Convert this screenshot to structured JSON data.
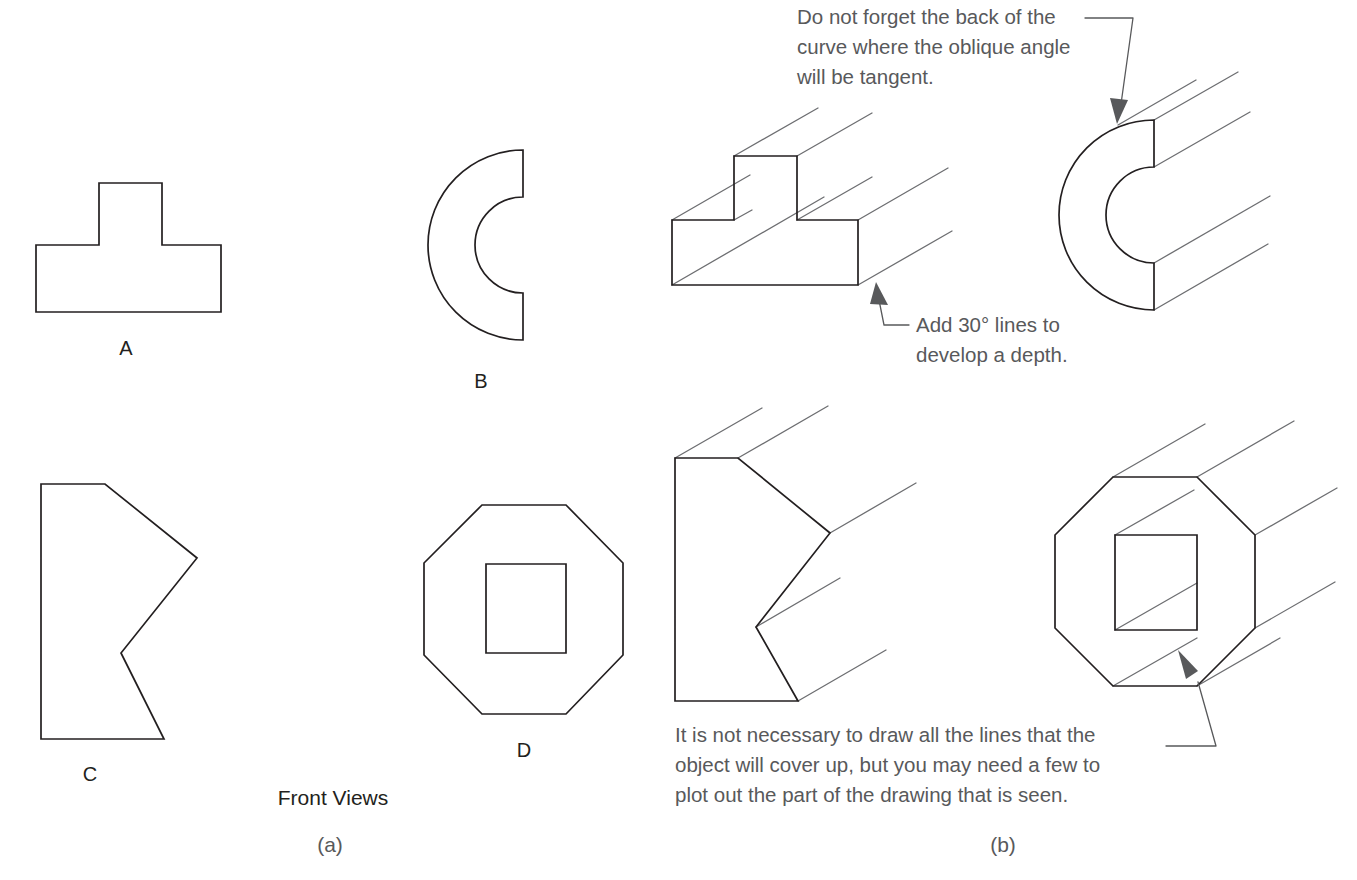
{
  "figure": {
    "panels": [
      {
        "key": "a",
        "caption": "(a)",
        "group_title": "Front Views"
      },
      {
        "key": "b",
        "caption": "(b)"
      }
    ],
    "front_views": {
      "title": "Front Views",
      "caption": "(a)",
      "shapes": [
        {
          "id": "A",
          "label": "A",
          "name": "tee-shape"
        },
        {
          "id": "B",
          "label": "B",
          "name": "semicircular-c-shape"
        },
        {
          "id": "C",
          "label": "C",
          "name": "notched-polygon-shape"
        },
        {
          "id": "D",
          "label": "D",
          "name": "octagon-with-square-hole"
        }
      ]
    },
    "oblique_views": {
      "caption": "(b)",
      "notes": [
        {
          "id": "note-curve-back",
          "lines": [
            "Do not forget the back of the",
            "curve where the oblique angle",
            "will be tangent."
          ]
        },
        {
          "id": "note-add-30-lines",
          "lines": [
            "Add 30° lines to",
            "develop a depth."
          ]
        },
        {
          "id": "note-hidden-lines",
          "lines": [
            "It is not necessary to draw all the lines that the",
            "object will cover up, but you may need a few to",
            "plot out the part of the drawing that is seen."
          ]
        }
      ]
    },
    "colors": {
      "object_line": "#231f20",
      "depth_line": "#6d6e71",
      "note_text": "#58595b",
      "label_text": "#231f20",
      "background": "#ffffff"
    },
    "oblique_angle_degrees": 30
  }
}
